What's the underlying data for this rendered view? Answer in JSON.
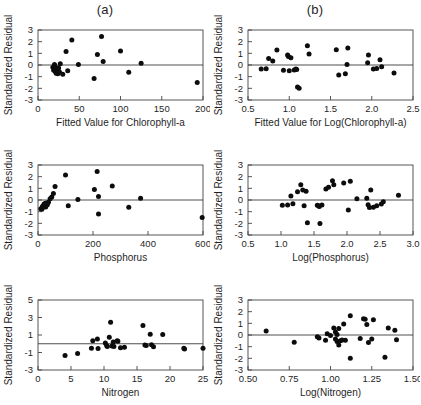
{
  "figure": {
    "panel_labels": {
      "left": "(a)",
      "right": "(b)"
    },
    "y_axis_title": "Standardized Residual"
  },
  "chart_data": [
    {
      "type": "scatter",
      "title": "(a)",
      "panel": "top-left",
      "xlabel": "Fitted Value for Chlorophyll-a",
      "ylabel": "Standardized Residual",
      "xlim": [
        0,
        200
      ],
      "ylim": [
        -3,
        3
      ],
      "xticks": [
        0,
        50,
        100,
        150,
        200
      ],
      "yticks": [
        -3,
        -2,
        -1,
        0,
        1,
        2,
        3
      ],
      "grid": false,
      "legend": "none",
      "reference_line_y": 0,
      "points": [
        [
          18,
          -0.2
        ],
        [
          19,
          -0.45
        ],
        [
          20,
          0.05
        ],
        [
          20,
          -0.3
        ],
        [
          21,
          -0.55
        ],
        [
          21,
          -0.15
        ],
        [
          22,
          -0.35
        ],
        [
          22,
          -0.7
        ],
        [
          23,
          -0.5
        ],
        [
          24,
          -0.75
        ],
        [
          25,
          -0.25
        ],
        [
          26,
          -0.6
        ],
        [
          27,
          0.1
        ],
        [
          30,
          -0.8
        ],
        [
          34,
          1.15
        ],
        [
          36,
          -0.5
        ],
        [
          41,
          2.15
        ],
        [
          49,
          0.05
        ],
        [
          68,
          -1.15
        ],
        [
          72,
          0.9
        ],
        [
          77,
          2.45
        ],
        [
          79,
          0.3
        ],
        [
          100,
          1.2
        ],
        [
          110,
          -0.62
        ],
        [
          125,
          0.15
        ],
        [
          193,
          -1.5
        ]
      ]
    },
    {
      "type": "scatter",
      "title": "(b)",
      "panel": "top-right",
      "xlabel": "Fitted Value for Log(Chlorophyll-a)",
      "ylabel": "Standardized Residual",
      "xlim": [
        0.5,
        2.5
      ],
      "ylim": [
        -3,
        3
      ],
      "xticks": [
        0.5,
        1.0,
        1.5,
        2.0,
        2.5
      ],
      "yticks": [
        -3,
        -2,
        -1,
        0,
        1,
        2,
        3
      ],
      "grid": false,
      "legend": "none",
      "reference_line_y": 0,
      "points": [
        [
          0.66,
          -0.35
        ],
        [
          0.72,
          -0.33
        ],
        [
          0.75,
          0.55
        ],
        [
          0.8,
          0.35
        ],
        [
          0.85,
          1.28
        ],
        [
          0.93,
          -0.45
        ],
        [
          0.98,
          0.85
        ],
        [
          0.99,
          0.72
        ],
        [
          1.0,
          -0.5
        ],
        [
          1.02,
          0.62
        ],
        [
          1.06,
          -0.42
        ],
        [
          1.08,
          -0.35
        ],
        [
          1.09,
          -0.38
        ],
        [
          1.1,
          -1.88
        ],
        [
          1.12,
          -2.0
        ],
        [
          1.22,
          1.65
        ],
        [
          1.24,
          0.95
        ],
        [
          1.57,
          1.3
        ],
        [
          1.6,
          -0.85
        ],
        [
          1.68,
          -0.75
        ],
        [
          1.7,
          0.05
        ],
        [
          1.71,
          1.45
        ],
        [
          1.95,
          0.2
        ],
        [
          1.96,
          0.85
        ],
        [
          2.02,
          -0.35
        ],
        [
          2.06,
          -0.3
        ],
        [
          2.1,
          0.45
        ],
        [
          2.12,
          -0.15
        ],
        [
          2.27,
          -0.68
        ]
      ]
    },
    {
      "type": "scatter",
      "panel": "middle-left",
      "xlabel": "Phosphorus",
      "ylabel": "Standardized Residual",
      "xlim": [
        0,
        600
      ],
      "ylim": [
        -3,
        3
      ],
      "xticks": [
        0,
        200,
        400,
        600
      ],
      "yticks": [
        -3,
        -2,
        -1,
        0,
        1,
        2,
        3
      ],
      "grid": false,
      "legend": "none",
      "reference_line_y": 0,
      "points": [
        [
          10,
          -0.75
        ],
        [
          14,
          -0.8
        ],
        [
          16,
          -0.55
        ],
        [
          18,
          -0.62
        ],
        [
          20,
          -0.5
        ],
        [
          22,
          -0.35
        ],
        [
          24,
          -0.45
        ],
        [
          26,
          -0.3
        ],
        [
          28,
          -0.6
        ],
        [
          30,
          -0.25
        ],
        [
          34,
          -0.4
        ],
        [
          38,
          -0.2
        ],
        [
          44,
          0.1
        ],
        [
          50,
          0.25
        ],
        [
          56,
          0.55
        ],
        [
          62,
          1.15
        ],
        [
          100,
          2.15
        ],
        [
          110,
          -0.5
        ],
        [
          145,
          0.05
        ],
        [
          205,
          0.9
        ],
        [
          215,
          2.45
        ],
        [
          220,
          0.3
        ],
        [
          220,
          -1.2
        ],
        [
          270,
          1.2
        ],
        [
          330,
          -0.62
        ],
        [
          373,
          0.15
        ],
        [
          597,
          -1.5
        ]
      ]
    },
    {
      "type": "scatter",
      "panel": "middle-right",
      "xlabel": "Log(Phosphorus)",
      "ylabel": "Standardized Residual",
      "xlim": [
        0.5,
        3.0
      ],
      "ylim": [
        -3,
        3
      ],
      "xticks": [
        0.5,
        1.0,
        1.5,
        2.0,
        2.5,
        3.0
      ],
      "yticks": [
        -3,
        -2,
        -1,
        0,
        1,
        2,
        3
      ],
      "grid": false,
      "legend": "none",
      "reference_line_y": 0,
      "points": [
        [
          1.02,
          -0.45
        ],
        [
          1.1,
          -0.42
        ],
        [
          1.15,
          0.35
        ],
        [
          1.18,
          -0.32
        ],
        [
          1.25,
          0.7
        ],
        [
          1.3,
          1.3
        ],
        [
          1.33,
          0.85
        ],
        [
          1.35,
          -0.5
        ],
        [
          1.38,
          0.75
        ],
        [
          1.4,
          -1.95
        ],
        [
          1.55,
          -0.45
        ],
        [
          1.57,
          -0.5
        ],
        [
          1.58,
          -0.55
        ],
        [
          1.59,
          -2.02
        ],
        [
          1.62,
          -0.42
        ],
        [
          1.68,
          0.95
        ],
        [
          1.72,
          1.1
        ],
        [
          1.78,
          1.65
        ],
        [
          1.8,
          1.3
        ],
        [
          1.95,
          1.45
        ],
        [
          2.02,
          -0.85
        ],
        [
          2.05,
          1.6
        ],
        [
          2.15,
          0.1
        ],
        [
          2.3,
          0.15
        ],
        [
          2.32,
          -0.4
        ],
        [
          2.34,
          -0.65
        ],
        [
          2.36,
          0.85
        ],
        [
          2.4,
          -0.62
        ],
        [
          2.45,
          -0.5
        ],
        [
          2.52,
          -0.35
        ],
        [
          2.55,
          -0.15
        ],
        [
          2.78,
          0.4
        ]
      ]
    },
    {
      "type": "scatter",
      "panel": "bottom-left",
      "xlabel": "Nitrogen",
      "ylabel": "Standardized Residual",
      "xlim": [
        0,
        25
      ],
      "ylim": [
        -3,
        5
      ],
      "xticks": [
        0,
        5,
        10,
        15,
        20,
        25
      ],
      "yticks": [
        -3,
        -1,
        1,
        3,
        5
      ],
      "grid": false,
      "legend": "none",
      "reference_line_y": 0,
      "points": [
        [
          4.1,
          -1.35
        ],
        [
          6.0,
          -1.1
        ],
        [
          8.1,
          -0.5
        ],
        [
          8.3,
          0.35
        ],
        [
          9.0,
          0.55
        ],
        [
          9.1,
          -0.55
        ],
        [
          10.2,
          0.1
        ],
        [
          10.4,
          -0.2
        ],
        [
          10.5,
          -0.3
        ],
        [
          10.8,
          0.75
        ],
        [
          11.0,
          2.45
        ],
        [
          11.2,
          -0.25
        ],
        [
          11.4,
          0.2
        ],
        [
          11.5,
          -0.3
        ],
        [
          12.0,
          0.35
        ],
        [
          12.1,
          0.3
        ],
        [
          12.5,
          -0.45
        ],
        [
          13.1,
          -0.4
        ],
        [
          15.9,
          2.1
        ],
        [
          16.2,
          -0.15
        ],
        [
          16.4,
          -0.2
        ],
        [
          17.0,
          1.1
        ],
        [
          17.2,
          -0.1
        ],
        [
          17.5,
          -0.35
        ],
        [
          18.9,
          1.05
        ],
        [
          22.1,
          -0.5
        ],
        [
          22.2,
          -0.6
        ],
        [
          25.0,
          -0.5
        ]
      ]
    },
    {
      "type": "scatter",
      "panel": "bottom-right",
      "xlabel": "Log(Nitrogen)",
      "ylabel": "Standardized Residual",
      "xlim": [
        0.5,
        1.5
      ],
      "ylim": [
        -3,
        3
      ],
      "xticks": [
        0.5,
        0.75,
        1.0,
        1.25,
        1.5
      ],
      "yticks": [
        -3,
        -2,
        -1,
        0,
        1,
        2,
        3
      ],
      "grid": false,
      "legend": "none",
      "reference_line_y": 0,
      "points": [
        [
          0.61,
          0.35
        ],
        [
          0.78,
          -0.62
        ],
        [
          0.92,
          -0.15
        ],
        [
          0.93,
          -0.25
        ],
        [
          0.97,
          -0.45
        ],
        [
          0.98,
          0.1
        ],
        [
          1.0,
          -0.05
        ],
        [
          1.02,
          0.6
        ],
        [
          1.03,
          0.25
        ],
        [
          1.03,
          -0.35
        ],
        [
          1.04,
          -0.55
        ],
        [
          1.04,
          0.05
        ],
        [
          1.05,
          -0.85
        ],
        [
          1.05,
          0.55
        ],
        [
          1.06,
          -0.5
        ],
        [
          1.07,
          -0.42
        ],
        [
          1.08,
          0.95
        ],
        [
          1.09,
          -0.45
        ],
        [
          1.12,
          1.65
        ],
        [
          1.12,
          -2.0
        ],
        [
          1.18,
          -0.3
        ],
        [
          1.2,
          1.4
        ],
        [
          1.21,
          1.35
        ],
        [
          1.22,
          0.9
        ],
        [
          1.23,
          -0.65
        ],
        [
          1.25,
          -0.35
        ],
        [
          1.26,
          1.3
        ],
        [
          1.33,
          -1.9
        ],
        [
          1.35,
          0.6
        ],
        [
          1.39,
          0.4
        ],
        [
          1.4,
          -0.4
        ]
      ]
    }
  ]
}
